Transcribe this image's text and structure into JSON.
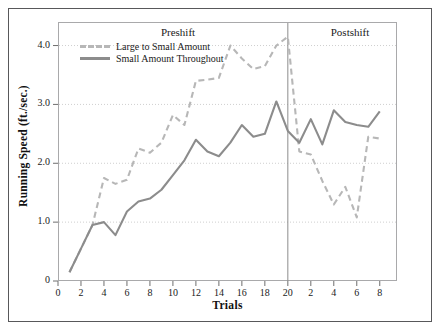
{
  "figure": {
    "frame_color": "#58585a",
    "plot_border_color": "#a9a9ab",
    "background": "#ffffff"
  },
  "chart_data": {
    "type": "line",
    "title": "",
    "xlabel": "Trials",
    "ylabel": "Running Speed (ft./sec.)",
    "xlim": [
      0,
      29.5
    ],
    "ylim": [
      0,
      4.4
    ],
    "grid": true,
    "grid_axis": "y",
    "legend_position": "top-left-inside",
    "y_ticks": [
      0,
      1.0,
      2.0,
      3.0,
      4.0
    ],
    "y_tick_labels": [
      "0",
      "1.0",
      "2.0",
      "3.0",
      "4.0"
    ],
    "x_ticks": [
      0,
      2,
      4,
      6,
      8,
      10,
      12,
      14,
      16,
      18,
      20,
      22,
      24,
      26,
      28
    ],
    "x_tick_labels": [
      "0",
      "2",
      "4",
      "6",
      "8",
      "10",
      "12",
      "14",
      "16",
      "18",
      "20",
      "2",
      "4",
      "6",
      "8"
    ],
    "annotations": [
      {
        "text": "Preshift",
        "x": 10,
        "position": "top"
      },
      {
        "text": "Postshift",
        "x": 24.5,
        "position": "top"
      }
    ],
    "shift_line": {
      "x": 20,
      "color": "#8c8c8c"
    },
    "x": [
      1,
      2,
      3,
      4,
      5,
      6,
      7,
      8,
      9,
      10,
      11,
      12,
      13,
      14,
      15,
      16,
      17,
      18,
      19,
      20,
      21,
      22,
      23,
      24,
      25,
      26,
      27,
      28
    ],
    "series": [
      {
        "name": "Large to Small Amount",
        "style": "dashed",
        "color": "#b7b7b7",
        "values": [
          0.15,
          0.55,
          0.95,
          1.22,
          0.82,
          1.18,
          1.52,
          1.45,
          1.72,
          1.88,
          1.78,
          2.25,
          2.33,
          2.28,
          2.65,
          2.45,
          2.75,
          3.1,
          3.4,
          4.15,
          2.2,
          2.15,
          1.7,
          1.3,
          1.6,
          1.08,
          2.45,
          2.42
        ]
      },
      {
        "name": "Small Amount Throughout",
        "style": "solid",
        "color": "#8c8c8c",
        "values": [
          0.15,
          0.55,
          0.95,
          1.0,
          0.78,
          1.18,
          1.35,
          1.4,
          1.55,
          1.8,
          2.05,
          2.4,
          2.2,
          2.12,
          2.35,
          2.65,
          2.45,
          2.5,
          3.05,
          2.55,
          2.35,
          2.75,
          2.32,
          2.9,
          2.7,
          2.65,
          2.62,
          2.88
        ]
      }
    ],
    "preshift_dashed_detail": [
      0.15,
      0.55,
      0.95,
      1.75,
      1.65,
      1.72,
      2.25,
      2.18,
      2.35,
      2.82,
      2.65,
      3.4,
      3.42,
      3.45,
      4.0,
      3.78,
      3.6,
      3.65,
      4.0,
      4.15
    ]
  },
  "legend": {
    "items": [
      {
        "label": "Large to Small Amount",
        "style": "dashed",
        "color": "#b7b7b7"
      },
      {
        "label": "Small Amount Throughout",
        "style": "solid",
        "color": "#8c8c8c"
      }
    ]
  }
}
